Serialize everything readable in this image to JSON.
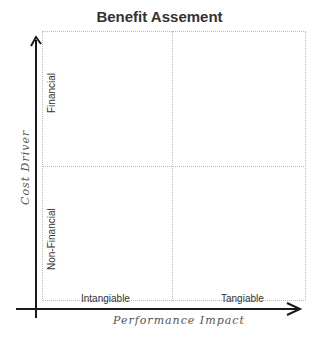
{
  "title": "Benefit Assement",
  "axes": {
    "y_title": "Cost Driver",
    "x_title": "Performance Impact"
  },
  "quadrant_labels": {
    "y_top": "Financial",
    "y_bottom": "Non-Financial",
    "x_left": "Intangiable",
    "x_right": "Tangiable"
  },
  "colors": {
    "axis": "#1a1a1a",
    "grid": "#bbbbbb",
    "text": "#333333"
  }
}
